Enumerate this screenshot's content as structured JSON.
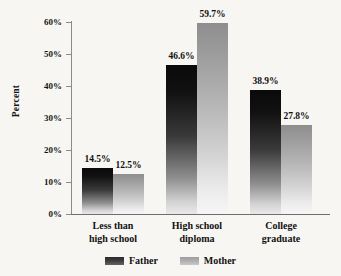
{
  "chart_data": {
    "type": "bar",
    "title": "",
    "subtitle": "",
    "xlabel": "",
    "ylabel": "Percent",
    "categories": [
      "Less than high school",
      "High school diploma",
      "College graduate"
    ],
    "category_lines": [
      [
        "Less than",
        "high school"
      ],
      [
        "High school",
        "diploma"
      ],
      [
        "College",
        "graduate"
      ]
    ],
    "series": [
      {
        "name": "Father",
        "values": [
          14.5,
          46.6,
          38.9
        ],
        "color": "#1a1a1a"
      },
      {
        "name": "Mother",
        "values": [
          12.5,
          59.7,
          27.8
        ],
        "color": "#a8a8a8"
      }
    ],
    "value_labels": [
      [
        "14.5%",
        "46.6%",
        "38.9%"
      ],
      [
        "12.5%",
        "59.7%",
        "27.8%"
      ]
    ],
    "ylim": [
      0,
      60
    ],
    "ytick_values": [
      0,
      10,
      20,
      30,
      40,
      50,
      60
    ],
    "ytick_labels": [
      "0%",
      "10%",
      "20%",
      "30%",
      "40%",
      "50%",
      "60%"
    ],
    "grid": false,
    "legend_position": "bottom",
    "legend_entries": [
      "Father",
      "Mother"
    ],
    "background_color": "#f7f6f3",
    "axis_color": "#8b8b8b"
  }
}
